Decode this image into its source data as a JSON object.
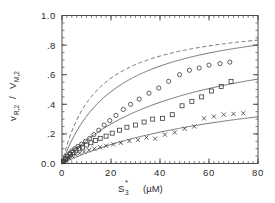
{
  "chart_data": {
    "type": "scatter",
    "title": "",
    "xlabel": "S3* (µM)",
    "xlabel_parts": {
      "base": "S",
      "subscript": "3",
      "superscript": "*",
      "units": "(µM)"
    },
    "ylabel": "v R,2 / V M,2",
    "ylabel_parts": {
      "num_base": "v",
      "num_sub": "R,2",
      "slash": "/",
      "den_base": "V",
      "den_sub": "M,2"
    },
    "xlim": [
      0,
      80
    ],
    "ylim": [
      0,
      1.0
    ],
    "xticks": [
      0,
      20,
      40,
      60,
      80
    ],
    "xtick_labels": [
      "0",
      "20",
      "40",
      "60",
      "80"
    ],
    "xticks_minor_step": 2,
    "yticks": [
      0.0,
      0.2,
      0.4,
      0.6,
      0.8,
      1.0
    ],
    "ytick_labels": [
      "0.0",
      ".2",
      ".4",
      ".6",
      ".8",
      "1.0"
    ],
    "yticks_minor_step": 0.05,
    "grid": false,
    "legend": "none",
    "frame": "box",
    "series": [
      {
        "name": "series-circles",
        "marker": "circle",
        "color": "#3a3a3a",
        "x": [
          0.6,
          1.4,
          2.2,
          3.1,
          4.0,
          5.2,
          6.5,
          8.0,
          9.6,
          11.3,
          13.0,
          15.0,
          17.2,
          19.5,
          22.0,
          25.0,
          28.0,
          31.5,
          35.5,
          39.5,
          43.5,
          48.0,
          52.0,
          56.0,
          60.0,
          64.5,
          68.5
        ],
        "y": [
          0.015,
          0.032,
          0.05,
          0.068,
          0.085,
          0.1,
          0.115,
          0.13,
          0.15,
          0.17,
          0.195,
          0.225,
          0.26,
          0.29,
          0.325,
          0.365,
          0.4,
          0.435,
          0.475,
          0.51,
          0.555,
          0.6,
          0.63,
          0.645,
          0.665,
          0.675,
          0.685
        ]
      },
      {
        "name": "series-squares",
        "marker": "square",
        "color": "#3a3a3a",
        "x": [
          0.6,
          1.5,
          2.4,
          3.4,
          4.5,
          5.7,
          7.0,
          8.4,
          10.0,
          11.8,
          13.6,
          15.6,
          18.0,
          20.5,
          23.5,
          26.5,
          30.0,
          33.5,
          37.0,
          41.0,
          45.0,
          49.0,
          53.0,
          57.0,
          61.0,
          65.0,
          69.0
        ],
        "y": [
          0.012,
          0.03,
          0.045,
          0.06,
          0.075,
          0.09,
          0.1,
          0.11,
          0.125,
          0.14,
          0.155,
          0.17,
          0.185,
          0.205,
          0.225,
          0.245,
          0.26,
          0.28,
          0.3,
          0.305,
          0.33,
          0.39,
          0.42,
          0.45,
          0.49,
          0.52,
          0.555
        ]
      },
      {
        "name": "series-crosses",
        "marker": "cross",
        "color": "#3a3a3a",
        "x": [
          0.8,
          1.8,
          3.0,
          4.2,
          5.6,
          7.2,
          9.0,
          11.0,
          13.2,
          15.5,
          18.0,
          21.0,
          24.0,
          27.5,
          31.0,
          34.5,
          38.0,
          42.0,
          46.0,
          50.0,
          54.0,
          58.0,
          62.0,
          66.0,
          70.0,
          74.0
        ],
        "y": [
          0.01,
          0.022,
          0.035,
          0.048,
          0.06,
          0.07,
          0.08,
          0.09,
          0.1,
          0.11,
          0.12,
          0.13,
          0.14,
          0.152,
          0.16,
          0.175,
          0.168,
          0.195,
          0.21,
          0.235,
          0.25,
          0.305,
          0.318,
          0.33,
          0.335,
          0.34
        ]
      }
    ],
    "curves": [
      {
        "name": "curve-dashed-upper",
        "style": "dashed",
        "vmax": 0.98,
        "km": 14.0,
        "color": "#5a5a5a"
      },
      {
        "name": "curve-solid-upper",
        "style": "solid",
        "vmax": 1.02,
        "km": 22.0,
        "color": "#5a5a5a"
      },
      {
        "name": "curve-solid-middle",
        "style": "solid",
        "vmax": 0.92,
        "km": 49.0,
        "color": "#5a5a5a"
      },
      {
        "name": "curve-solid-lower",
        "style": "solid",
        "vmax": 0.62,
        "km": 77.0,
        "color": "#5a5a5a"
      }
    ]
  }
}
